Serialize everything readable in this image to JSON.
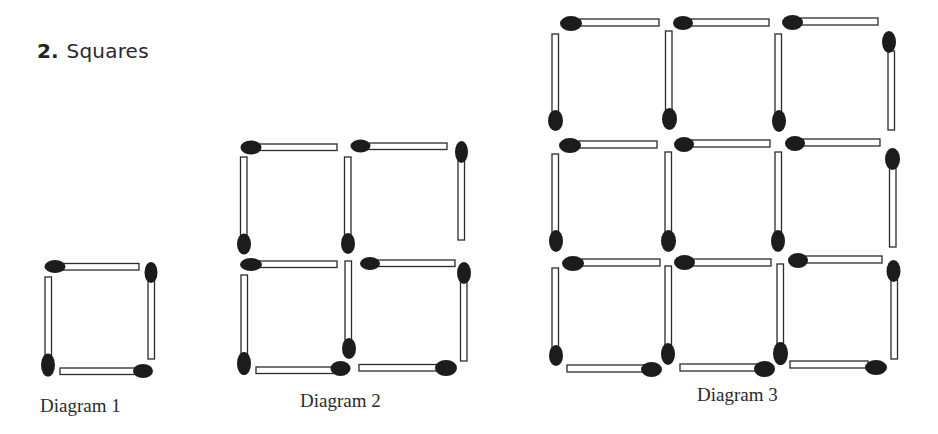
{
  "title": {
    "number": "2.",
    "text": "Squares"
  },
  "diagrams": [
    {
      "label": "Diagram 1",
      "squares": 1,
      "matchsticks": 4,
      "grid": "1x1"
    },
    {
      "label": "Diagram 2",
      "squares": 4,
      "matchsticks": 12,
      "grid": "2x2"
    },
    {
      "label": "Diagram 3",
      "squares": 9,
      "matchsticks": 24,
      "grid": "3x3"
    }
  ],
  "colors": {
    "match_head": "#1c1c1c",
    "stick_fill": "#ffffff",
    "stick_outline": "#2b2b2b",
    "text": "#2a2a2a",
    "background": "#ffffff"
  }
}
